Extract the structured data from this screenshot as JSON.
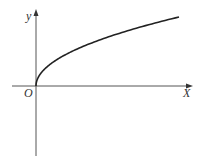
{
  "chart_data": {
    "type": "line",
    "title": "",
    "function": "y = sqrt(x)",
    "xlabel": "X",
    "ylabel": "y",
    "origin_label": "O",
    "grid": false,
    "legend": null,
    "series": [
      {
        "name": "y = √x",
        "x": [
          0,
          0.01,
          0.05,
          0.1,
          0.2,
          0.35,
          0.5,
          0.7,
          0.85,
          1.0
        ],
        "y": [
          0,
          0.1,
          0.224,
          0.316,
          0.447,
          0.592,
          0.707,
          0.837,
          0.922,
          1.0
        ]
      }
    ],
    "xlim": [
      -0.17,
      1.1
    ],
    "ylim": [
      -0.95,
      1.1
    ]
  },
  "labels": {
    "y_axis": "y",
    "x_axis": "X",
    "origin": "O"
  },
  "colors": {
    "axis": "#555555",
    "curve": "#222222",
    "background": "#ffffff"
  }
}
